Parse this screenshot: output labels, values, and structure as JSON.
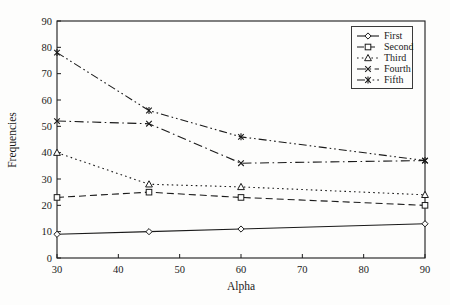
{
  "figure": {
    "background": "#fdfdfc",
    "stroke_color": "#1a1a1a"
  },
  "chart_data": {
    "type": "line",
    "title": "",
    "xlabel": "Alpha",
    "ylabel": "Frequencies",
    "x": [
      30,
      45,
      60,
      90
    ],
    "xlim": [
      30,
      90
    ],
    "ylim": [
      0,
      90
    ],
    "xticks": [
      30,
      40,
      50,
      60,
      70,
      80,
      90
    ],
    "yticks": [
      0,
      10,
      20,
      30,
      40,
      50,
      60,
      70,
      80,
      90
    ],
    "grid": false,
    "legend_position": "top-right",
    "series": [
      {
        "name": "First",
        "marker": "diamond",
        "line": "solid",
        "values": [
          9,
          10,
          11,
          13
        ]
      },
      {
        "name": "Second",
        "marker": "square",
        "line": "dashed",
        "values": [
          23,
          25,
          23,
          20
        ]
      },
      {
        "name": "Third",
        "marker": "triangle",
        "line": "dotted",
        "values": [
          40,
          28,
          27,
          24
        ]
      },
      {
        "name": "Fourth",
        "marker": "x",
        "line": "dashdot",
        "values": [
          52,
          51,
          36,
          37
        ]
      },
      {
        "name": "Fifth",
        "marker": "star6",
        "line": "dashdotdot",
        "values": [
          78,
          56,
          46,
          37
        ]
      }
    ]
  }
}
